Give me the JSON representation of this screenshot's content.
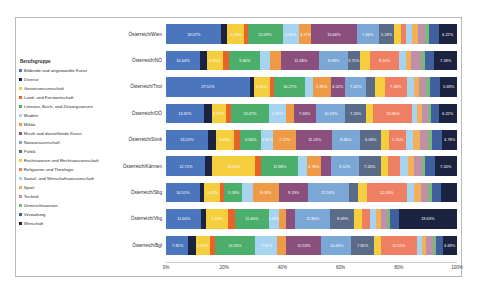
{
  "chart_data": {
    "type": "bar",
    "orientation": "horizontal",
    "stacked": true,
    "normalized": "100%",
    "title": "",
    "xlabel": "",
    "ylabel": "",
    "xlim": [
      0,
      100
    ],
    "xticks": [
      "0%",
      "20%",
      "40%",
      "60%",
      "80%",
      "100%"
    ],
    "grid": false,
    "legend_position": "left",
    "legend_title": "Berufsgruppe",
    "categories": [
      "Österreich/Wien",
      "Österreich/NÖ",
      "Österreich/Tirol",
      "Österreich/OÖ",
      "Österreich/Stmk",
      "Österreich/Kärnten",
      "Österreich/Sbg",
      "Österreich/Vbg",
      "Österreich/Bgl"
    ],
    "series": [
      {
        "name": "Bildende und angewandte Kunst",
        "color": "#4b76bd",
        "values": [
          19.07,
          10.44,
          27.51,
          13.35,
          13.22,
          12.71,
          10.51,
          11.66,
          7.81
        ],
        "labels": [
          "19.07%",
          "10.44%",
          "27.51%",
          "13.35%",
          "13.22%",
          "12.71%",
          "10.51%",
          "11.66%",
          "7.81%"
        ]
      },
      {
        "name": "Diverse",
        "color": "#1c2340",
        "values": [
          2.1,
          2.2,
          1.3,
          2.6,
          2.3,
          2.4,
          1.4,
          2.0,
          2.5
        ],
        "labels": [
          "",
          "",
          "",
          "",
          "",
          "",
          "",
          "",
          ""
        ]
      },
      {
        "name": "Geisteswissenschaft",
        "color": "#f5ce3e",
        "values": [
          5.53,
          5.05,
          5.51,
          5.17,
          5.63,
          14.01,
          5.02,
          7.23,
          5.05
        ],
        "labels": [
          "5.53%",
          "5.05%",
          "5.51%",
          "5.17%",
          "5.63%",
          "14.01%",
          "5.02%",
          "7.23%",
          "5.05%"
        ]
      },
      {
        "name": "Land- und Forstwirtschaft",
        "color": "#e8622a",
        "values": [
          1.4,
          1.9,
          1.1,
          1.5,
          2.0,
          2.1,
          1.2,
          2.3,
          1.6
        ],
        "labels": [
          "",
          "",
          "",
          "",
          "",
          "",
          "",
          "",
          ""
        ]
      },
      {
        "name": "Literatur, Buch- und Zeitungswesen",
        "color": "#4cae6b",
        "values": [
          12.09,
          9.66,
          10.27,
          13.47,
          6.66,
          11.98,
          5.59,
          11.66,
          14.26
        ],
        "labels": [
          "12.09%",
          "9.66%",
          "10.27%",
          "13.47%",
          "6.66%",
          "11.98%",
          "5.59%",
          "11.66%",
          "14.26%"
        ]
      },
      {
        "name": "Medien",
        "color": "#a6d3ef",
        "values": [
          5.65,
          3.1,
          2.6,
          5.87,
          3.81,
          2.9,
          3.2,
          3.19,
          7.61
        ],
        "labels": [
          "5.65%",
          "",
          "",
          "5.87%",
          "3.81%",
          "",
          "",
          "3.19%",
          "7.61%"
        ]
      },
      {
        "name": "Militär",
        "color": "#ef9a47",
        "values": [
          4.27,
          3.4,
          5.92,
          2.9,
          7.17,
          4.78,
          8.09,
          2.6,
          2.9
        ],
        "labels": [
          "4.27%",
          "",
          "5.92%",
          "",
          "7.17%",
          "4.78%",
          "8.09%",
          "",
          ""
        ]
      },
      {
        "name": "Musik und darstellende Kunst",
        "color": "#8a4f7d",
        "values": [
          15.66,
          11.58,
          4.52,
          7.63,
          11.24,
          3.0,
          9.19,
          3.1,
          12.53
        ],
        "labels": [
          "15.66%",
          "11.58%",
          "4.52%",
          "7.63%",
          "11.24%",
          "",
          "9.19%",
          "",
          "12.53%"
        ]
      },
      {
        "name": "Naturwissenschaft",
        "color": "#7ba7d7",
        "values": [
          7.66,
          8.99,
          7.02,
          10.19,
          8.66,
          9.12,
          12.59,
          11.86,
          10.46
        ],
        "labels": [
          "7.66%",
          "8.99%",
          "7.02%",
          "10.19%",
          "8.66%",
          "9.12%",
          "12.59%",
          "11.86%",
          "10.46%"
        ]
      },
      {
        "name": "Politik",
        "color": "#5a6b88",
        "values": [
          5.19,
          3.71,
          3.0,
          7.2,
          6.63,
          7.2,
          2.8,
          8.09,
          7.81
        ],
        "labels": [
          "5.19%",
          "3.71%",
          "",
          "7.20%",
          "6.63%",
          "7.20%",
          "",
          "8.09%",
          "7.81%"
        ]
      },
      {
        "name": "Rechtswesen und Rechtswissenschaft",
        "color": "#f5ce3e",
        "values": [
          2.5,
          3.0,
          3.1,
          2.7,
          2.6,
          2.5,
          3.0,
          2.6,
          2.4
        ],
        "labels": [
          "",
          "",
          "",
          "",
          "",
          "",
          "",
          "",
          ""
        ]
      },
      {
        "name": "Religionen und Theologie",
        "color": "#ef7f62",
        "values": [
          1.6,
          9.16,
          7.36,
          13.36,
          5.15,
          4.0,
          12.33,
          2.5,
          12.55
        ],
        "labels": [
          "",
          "9.16%",
          "7.36%",
          "13.36%",
          "5.15%",
          "",
          "12.33%",
          "",
          "12.55%"
        ]
      },
      {
        "name": "Sozial- und Wirtschaftswissenschaft",
        "color": "#a6d3ef",
        "values": [
          2.2,
          2.0,
          2.4,
          1.9,
          2.3,
          2.6,
          2.1,
          2.2,
          1.8
        ],
        "labels": [
          "",
          "",
          "",
          "",
          "",
          "",
          "",
          "",
          ""
        ]
      },
      {
        "name": "Sport",
        "color": "#f3b05a",
        "values": [
          2.0,
          1.8,
          1.7,
          1.6,
          2.0,
          1.9,
          2.2,
          1.7,
          1.5
        ],
        "labels": [
          "",
          "",
          "",
          "",
          "",
          "",
          "",
          "",
          ""
        ]
      },
      {
        "name": "Technik",
        "color": "#c08fa8",
        "values": [
          2.4,
          2.9,
          2.3,
          2.2,
          2.6,
          2.5,
          2.4,
          2.0,
          2.3
        ],
        "labels": [
          "",
          "",
          "",
          "",
          "",
          "",
          "",
          "",
          ""
        ]
      },
      {
        "name": "Unterrichtswesen",
        "color": "#7cb87c",
        "values": [
          1.3,
          1.2,
          1.1,
          1.0,
          1.3,
          1.2,
          1.1,
          1.0,
          1.2
        ],
        "labels": [
          "",
          "",
          "",
          "",
          "",
          "",
          "",
          "",
          ""
        ]
      },
      {
        "name": "Verwaltung",
        "color": "#3f5f9e",
        "values": [
          3.4,
          2.8,
          3.2,
          2.9,
          3.0,
          3.1,
          2.8,
          3.0,
          2.6
        ],
        "labels": [
          "",
          "",
          "",
          "",
          "",
          "",
          "",
          "",
          ""
        ]
      },
      {
        "name": "Wirtschaft",
        "color": "#1c2340",
        "values": [
          6.22,
          7.18,
          5.69,
          6.22,
          4.78,
          7.2,
          5.0,
          19.63,
          4.69
        ],
        "labels": [
          "6.22%",
          "7.18%",
          "5.69%",
          "6.22%",
          "4.78%",
          "7.20%",
          "",
          "19.63%",
          "4.69%"
        ]
      }
    ]
  },
  "legend": {
    "title": "Berufsgruppe",
    "items": [
      {
        "label": "Bildende und angewandte Kunst",
        "color": "#4b76bd"
      },
      {
        "label": "Diverse",
        "color": "#1c2340"
      },
      {
        "label": "Geisteswissenschaft",
        "color": "#f5ce3e"
      },
      {
        "label": "Land- und Forstwirtschaft",
        "color": "#e8622a"
      },
      {
        "label": "Literatur, Buch- und Zeitungswesen",
        "color": "#4cae6b"
      },
      {
        "label": "Medien",
        "color": "#a6d3ef"
      },
      {
        "label": "Militär",
        "color": "#ef9a47"
      },
      {
        "label": "Musik und darstellende Kunst",
        "color": "#8a4f7d"
      },
      {
        "label": "Naturwissenschaft",
        "color": "#7ba7d7"
      },
      {
        "label": "Politik",
        "color": "#5a6b88"
      },
      {
        "label": "Rechtswesen und Rechtswissenschaft",
        "color": "#f5ce3e"
      },
      {
        "label": "Religionen und Theologie",
        "color": "#ef7f62"
      },
      {
        "label": "Sozial- und Wirtschaftswissenschaft",
        "color": "#a6d3ef"
      },
      {
        "label": "Sport",
        "color": "#f3b05a"
      },
      {
        "label": "Technik",
        "color": "#c08fa8"
      },
      {
        "label": "Unterrichtswesen",
        "color": "#7cb87c"
      },
      {
        "label": "Verwaltung",
        "color": "#3f5f9e"
      },
      {
        "label": "Wirtschaft",
        "color": "#1c2340"
      }
    ]
  }
}
